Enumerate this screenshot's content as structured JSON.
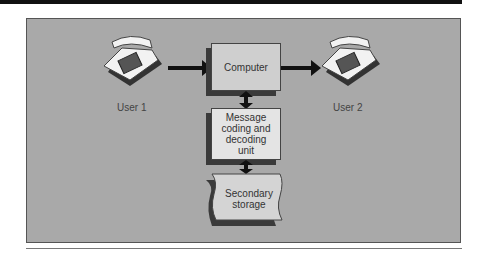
{
  "diagram": {
    "nodes": {
      "computer": "Computer",
      "message_unit": "Message coding and decoding unit",
      "storage_line1": "Secondary",
      "storage_line2": "storage",
      "msg_line1": "Message",
      "msg_line2": "coding and",
      "msg_line3": "decoding",
      "msg_line4": "unit"
    },
    "users": {
      "user1": "User 1",
      "user2": "User 2"
    },
    "edges": [
      {
        "from": "User 1",
        "to": "Computer",
        "type": "one-way"
      },
      {
        "from": "Computer",
        "to": "User 2",
        "type": "one-way"
      },
      {
        "from": "Computer",
        "to": "Message coding and decoding unit",
        "type": "two-way"
      },
      {
        "from": "Message coding and decoding unit",
        "to": "Secondary storage",
        "type": "two-way"
      }
    ],
    "colors": {
      "panel": "#a9a9a9",
      "box": "#cfcfcf",
      "arrow": "#111111"
    }
  }
}
